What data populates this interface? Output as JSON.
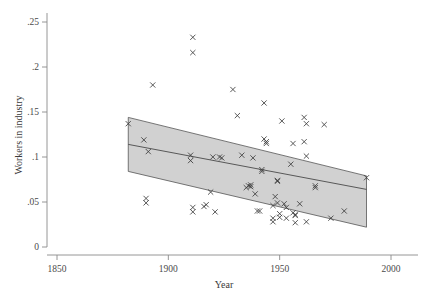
{
  "chart_data": {
    "type": "scatter",
    "title": "",
    "xlabel": "Year",
    "ylabel": "Workers in industry",
    "xlim": [
      1850,
      2000
    ],
    "ylim": [
      0,
      0.26
    ],
    "xticks": [
      1850,
      1900,
      1950,
      2000
    ],
    "xticklabels": [
      "1850",
      "1900",
      "1950",
      "2000"
    ],
    "yticks": [
      0,
      0.05,
      0.1,
      0.15,
      0.2,
      0.25
    ],
    "yticklabels": [
      "0",
      ".05",
      ".1",
      ".15",
      ".2",
      ".25"
    ],
    "grid": false,
    "legend": null,
    "marker": "x",
    "points": [
      {
        "x": 1882,
        "y": 0.137
      },
      {
        "x": 1889,
        "y": 0.119
      },
      {
        "x": 1890,
        "y": 0.054
      },
      {
        "x": 1890,
        "y": 0.049
      },
      {
        "x": 1891,
        "y": 0.106
      },
      {
        "x": 1893,
        "y": 0.18
      },
      {
        "x": 1910,
        "y": 0.102
      },
      {
        "x": 1910,
        "y": 0.096
      },
      {
        "x": 1911,
        "y": 0.233
      },
      {
        "x": 1911,
        "y": 0.216
      },
      {
        "x": 1911,
        "y": 0.044
      },
      {
        "x": 1911,
        "y": 0.039
      },
      {
        "x": 1916,
        "y": 0.045
      },
      {
        "x": 1917,
        "y": 0.047
      },
      {
        "x": 1919,
        "y": 0.061
      },
      {
        "x": 1920,
        "y": 0.1
      },
      {
        "x": 1921,
        "y": 0.039
      },
      {
        "x": 1923,
        "y": 0.1
      },
      {
        "x": 1924,
        "y": 0.099
      },
      {
        "x": 1929,
        "y": 0.175
      },
      {
        "x": 1931,
        "y": 0.146
      },
      {
        "x": 1933,
        "y": 0.102
      },
      {
        "x": 1935,
        "y": 0.066
      },
      {
        "x": 1936,
        "y": 0.068
      },
      {
        "x": 1937,
        "y": 0.069
      },
      {
        "x": 1937,
        "y": 0.067
      },
      {
        "x": 1938,
        "y": 0.099
      },
      {
        "x": 1939,
        "y": 0.059
      },
      {
        "x": 1940,
        "y": 0.04
      },
      {
        "x": 1941,
        "y": 0.04
      },
      {
        "x": 1942,
        "y": 0.086
      },
      {
        "x": 1942,
        "y": 0.084
      },
      {
        "x": 1943,
        "y": 0.16
      },
      {
        "x": 1943,
        "y": 0.12
      },
      {
        "x": 1944,
        "y": 0.117
      },
      {
        "x": 1944,
        "y": 0.115
      },
      {
        "x": 1947,
        "y": 0.046
      },
      {
        "x": 1947,
        "y": 0.032
      },
      {
        "x": 1947,
        "y": 0.028
      },
      {
        "x": 1948,
        "y": 0.056
      },
      {
        "x": 1949,
        "y": 0.074
      },
      {
        "x": 1949,
        "y": 0.073
      },
      {
        "x": 1949,
        "y": 0.049
      },
      {
        "x": 1950,
        "y": 0.033
      },
      {
        "x": 1950,
        "y": 0.037
      },
      {
        "x": 1951,
        "y": 0.14
      },
      {
        "x": 1952,
        "y": 0.048
      },
      {
        "x": 1953,
        "y": 0.044
      },
      {
        "x": 1953,
        "y": 0.032
      },
      {
        "x": 1955,
        "y": 0.092
      },
      {
        "x": 1956,
        "y": 0.115
      },
      {
        "x": 1956,
        "y": 0.038
      },
      {
        "x": 1957,
        "y": 0.036
      },
      {
        "x": 1957,
        "y": 0.035
      },
      {
        "x": 1957,
        "y": 0.027
      },
      {
        "x": 1959,
        "y": 0.048
      },
      {
        "x": 1961,
        "y": 0.144
      },
      {
        "x": 1961,
        "y": 0.117
      },
      {
        "x": 1962,
        "y": 0.101
      },
      {
        "x": 1962,
        "y": 0.137
      },
      {
        "x": 1962,
        "y": 0.028
      },
      {
        "x": 1966,
        "y": 0.068
      },
      {
        "x": 1966,
        "y": 0.066
      },
      {
        "x": 1970,
        "y": 0.136
      },
      {
        "x": 1973,
        "y": 0.032
      },
      {
        "x": 1979,
        "y": 0.04
      },
      {
        "x": 1989,
        "y": 0.077
      }
    ],
    "fit_line": {
      "x_start": 1882,
      "y_start": 0.114,
      "x_end": 1989,
      "y_end": 0.064
    },
    "confidence_band": {
      "x_start": 1882,
      "x_end": 1989,
      "upper_start": 0.144,
      "upper_end": 0.079,
      "lower_start": 0.084,
      "lower_end": 0.022
    }
  }
}
